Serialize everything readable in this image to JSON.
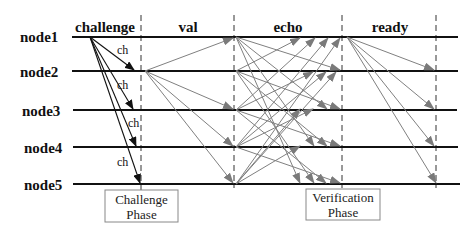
{
  "diagram": {
    "type": "message-sequence",
    "phases": [
      {
        "id": "challenge",
        "label": "challenge",
        "x": 105
      },
      {
        "id": "val",
        "label": "val",
        "x": 188
      },
      {
        "id": "echo",
        "label": "echo",
        "x": 288
      },
      {
        "id": "ready",
        "label": "ready",
        "x": 390
      }
    ],
    "nodes": [
      {
        "id": "node1",
        "label": "node1",
        "y": 37
      },
      {
        "id": "node2",
        "label": "node2",
        "y": 71
      },
      {
        "id": "node3",
        "label": "node3",
        "y": 110
      },
      {
        "id": "node4",
        "label": "node4",
        "y": 147
      },
      {
        "id": "node5",
        "label": "node5",
        "y": 184
      }
    ],
    "dividers_x": [
      141,
      234,
      342,
      436
    ],
    "line_start_x": 72,
    "line_end_x": 458,
    "challenge_messages": {
      "label": "ch",
      "from": "node1",
      "to": [
        "node2",
        "node3",
        "node4",
        "node5"
      ],
      "labels": [
        {
          "text": "ch",
          "x": 118,
          "y": 53
        },
        {
          "text": "ch",
          "x": 117,
          "y": 89
        },
        {
          "text": "ch",
          "x": 128,
          "y": 126
        },
        {
          "text": "ch",
          "x": 118,
          "y": 166
        }
      ]
    },
    "val_messages": {
      "from": "node2",
      "to": [
        "node1",
        "node3",
        "node4",
        "node5"
      ]
    },
    "echo_messages": {
      "pattern": "all-to-all",
      "from": [
        "node1",
        "node2",
        "node3",
        "node4",
        "node5"
      ]
    },
    "ready_messages": {
      "from": "node1",
      "to": [
        "node2",
        "node3",
        "node4",
        "node5"
      ]
    },
    "boxes": [
      {
        "id": "challenge-phase",
        "line1": "Challenge",
        "line2": "Phase",
        "x": 105,
        "y": 190,
        "w": 73,
        "h": 32
      },
      {
        "id": "verification-phase",
        "line1": "Verification",
        "line2": "Phase",
        "x": 306,
        "y": 189,
        "w": 74,
        "h": 31
      }
    ],
    "colors": {
      "node_line": "#111111",
      "challenge_arrow": "#111111",
      "message_arrow": "#808080",
      "box_border": "#888888"
    }
  }
}
